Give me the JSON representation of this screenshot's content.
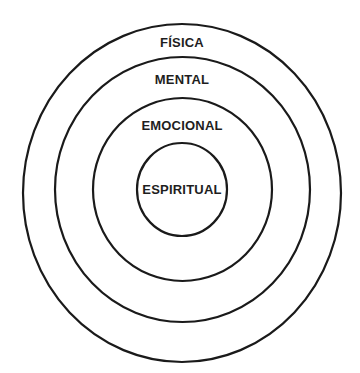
{
  "diagram": {
    "type": "concentric-circles",
    "stroke_color": "#1a1a1a",
    "text_color": "#1e1e1e",
    "background": "#ffffff",
    "rings": [
      {
        "id": "fisica",
        "label": "FÍSICA",
        "order": 1
      },
      {
        "id": "mental",
        "label": "MENTAL",
        "order": 2
      },
      {
        "id": "emocional",
        "label": "EMOCIONAL",
        "order": 3
      },
      {
        "id": "espiritual",
        "label": "ESPIRITUAL",
        "order": 4
      }
    ]
  }
}
